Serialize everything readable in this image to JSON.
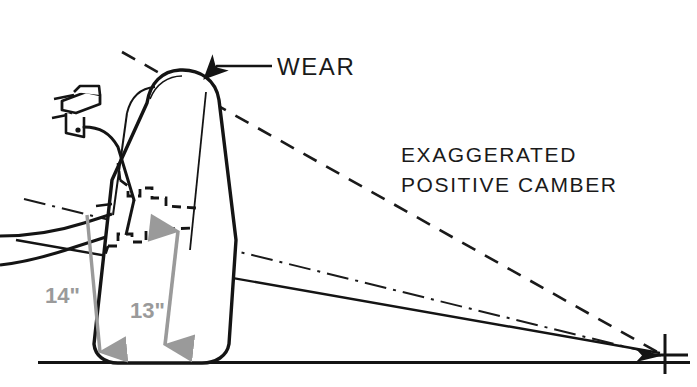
{
  "figure": {
    "background_color": "#ffffff",
    "line_color": "#111111",
    "gray_color": "#9a9a9a",
    "wear_band_color": "#c9c9c9",
    "width": 697,
    "height": 387
  },
  "annotations": {
    "wear_label": "WEAR",
    "camber_label_line1": "EXAGGERATED",
    "camber_label_line2": "POSITIVE CAMBER"
  },
  "dimensions": [
    {
      "id": "tire-height-inboard",
      "label": "14\"",
      "value": 14,
      "unit": "inch",
      "color": "#9a9a9a",
      "description": "inboard side vertical height of tilted wheel"
    },
    {
      "id": "tire-height-outboard",
      "label": "13\"",
      "value": 13,
      "unit": "inch",
      "color": "#9a9a9a",
      "description": "outboard wear band length along tilted wheel"
    }
  ],
  "elements": {
    "ground_line": "ground-reference-line",
    "camber_centerline": "wheel-axis-dash-dot-line",
    "camber_projection": "camber-angle-dashed-line",
    "convergence_mark": "crosshair-vanishing-point",
    "tire": "tilted-tire-outline",
    "wear_band": "outer-edge-wear-shading",
    "suspension": "upper-strut-and-control-arms",
    "brake_parts": "dashed-brake-backing-plate"
  }
}
